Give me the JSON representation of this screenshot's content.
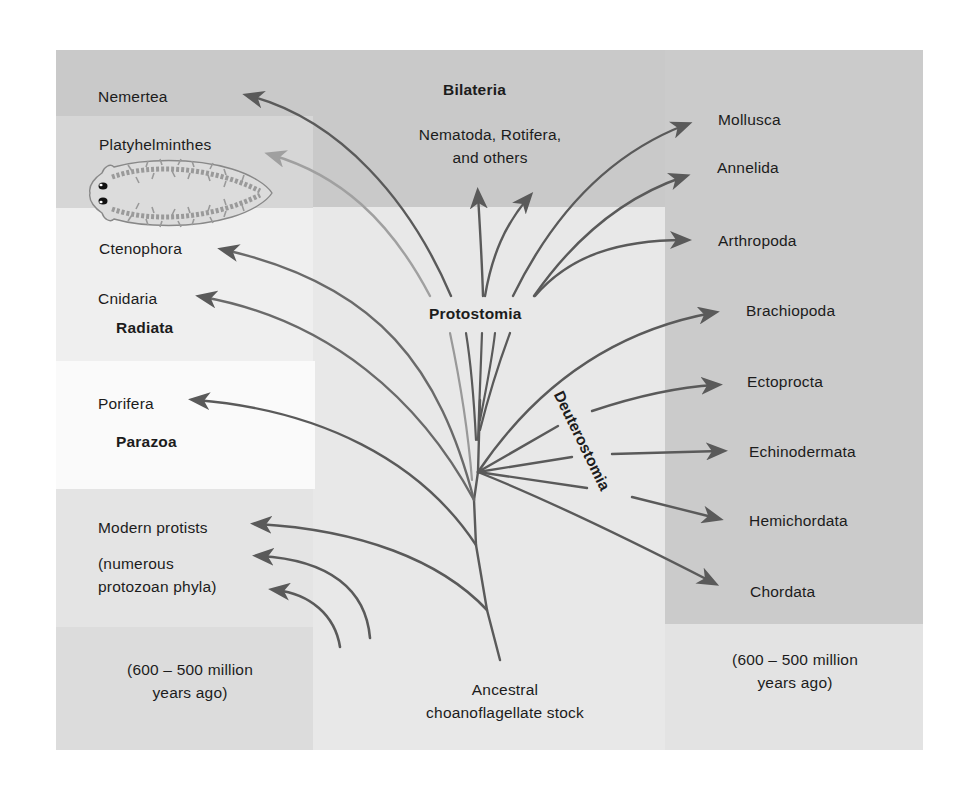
{
  "figure": {
    "colors": {
      "page_background": "#ffffff",
      "outer_box": "#e3e3e3",
      "bilateria_band": "#c9c9c9",
      "platyhelminthes_band": "#d7d7d7",
      "radiata_band": "#ececec",
      "parazoa_band": "#fafafa",
      "right_panel": "#cbcbcb",
      "center_column": "#e9e9e9",
      "branch_dark": "#5a5a5a",
      "branch_light": "#9a9a9a"
    },
    "groups": {
      "bilateria": "Bilateria",
      "protostomia": "Protostomia",
      "deuterostomia": "Deuterostomia",
      "radiata": "Radiata",
      "parazoa": "Parazoa"
    },
    "phyla_left": {
      "nemertea": "Nemertea",
      "platyhelminthes": "Platyhelminthes",
      "ctenophora": "Ctenophora",
      "cnidaria": "Cnidaria",
      "porifera": "Porifera",
      "modern_protists": "Modern protists",
      "protozoan_line1": "(numerous",
      "protozoan_line2": "protozoan phyla)"
    },
    "phyla_center": {
      "nematoda_line1": "Nematoda, Rotifera,",
      "nematoda_line2": "and others"
    },
    "phyla_right": {
      "mollusca": "Mollusca",
      "annelida": "Annelida",
      "arthropoda": "Arthropoda",
      "brachiopoda": "Brachiopoda",
      "ectoprocta": "Ectoprocta",
      "echinodermata": "Echinodermata",
      "hemichordata": "Hemichordata",
      "chordata": "Chordata"
    },
    "time_left": {
      "line1": "(600 – 500 million",
      "line2": "years ago)"
    },
    "time_right": {
      "line1": "(600 – 500 million",
      "line2": "years ago)"
    },
    "root": {
      "line1": "Ancestral",
      "line2": "choanoflagellate stock"
    },
    "illustration": "flatworm (planarian) drawing"
  }
}
